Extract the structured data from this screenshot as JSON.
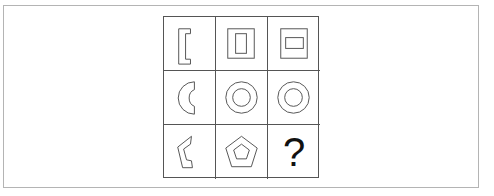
{
  "puzzle": {
    "stroke_color": "#555555",
    "grid_line_color": "#555555",
    "frame_color": "#b4b4b4",
    "cells": [
      {
        "row": 1,
        "col": 1,
        "shape": "bracket-partial-rectangle"
      },
      {
        "row": 1,
        "col": 2,
        "shape": "nested-rectangles-tall-inner"
      },
      {
        "row": 1,
        "col": 3,
        "shape": "nested-rectangles-wide-inner"
      },
      {
        "row": 2,
        "col": 1,
        "shape": "partial-ring-c-shape"
      },
      {
        "row": 2,
        "col": 2,
        "shape": "concentric-circles"
      },
      {
        "row": 2,
        "col": 3,
        "shape": "concentric-circles"
      },
      {
        "row": 3,
        "col": 1,
        "shape": "partial-pentagon-ring"
      },
      {
        "row": 3,
        "col": 2,
        "shape": "nested-pentagons"
      },
      {
        "row": 3,
        "col": 3,
        "shape": "question-mark",
        "text": "?"
      }
    ],
    "answer_placeholder": "?"
  }
}
